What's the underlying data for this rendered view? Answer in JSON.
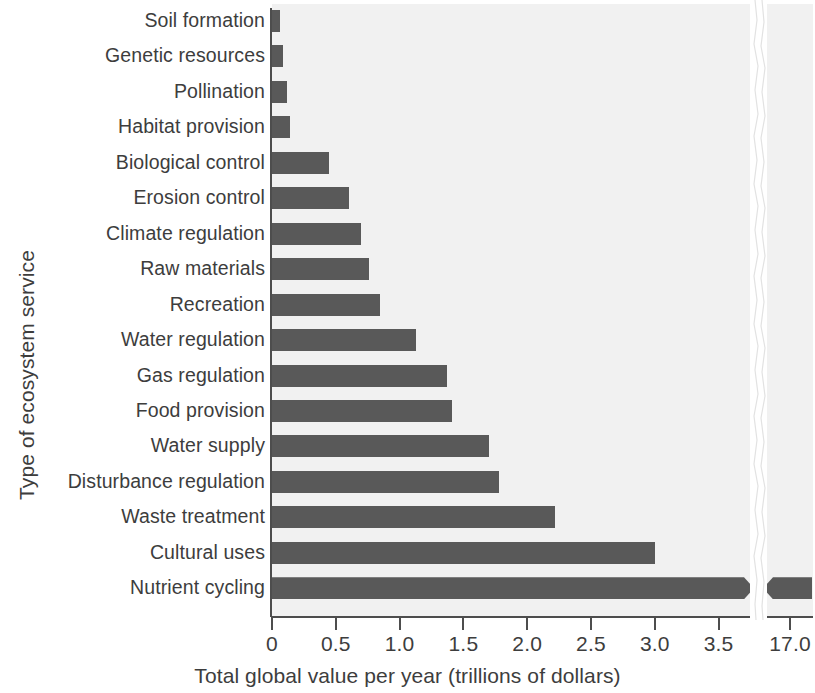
{
  "chart_data": {
    "type": "bar",
    "orientation": "horizontal",
    "title": "",
    "xlabel": "Total global value per year (trillions of dollars)",
    "ylabel": "Type of ecosystem service",
    "xlim": [
      0,
      3.7
    ],
    "axis_break": {
      "present": true,
      "break_after": 3.7,
      "resume_label": "17.0"
    },
    "grid": false,
    "legend": null,
    "bar_color": "#595959",
    "plot_background": "#f1f1f1",
    "xticks": [
      "0",
      "0.5",
      "1.0",
      "1.5",
      "2.0",
      "2.5",
      "3.0",
      "3.5",
      "17.0"
    ],
    "xtick_values": [
      0,
      0.5,
      1.0,
      1.5,
      2.0,
      2.5,
      3.0,
      3.5,
      17.0
    ],
    "categories": [
      "Soil formation",
      "Genetic resources",
      "Pollination",
      "Habitat provision",
      "Biological control",
      "Erosion control",
      "Climate regulation",
      "Raw materials",
      "Recreation",
      "Water regulation",
      "Gas regulation",
      "Food provision",
      "Water supply",
      "Disturbance regulation",
      "Waste treatment",
      "Cultural uses",
      "Nutrient cycling"
    ],
    "values": [
      0.06,
      0.09,
      0.12,
      0.14,
      0.45,
      0.6,
      0.7,
      0.76,
      0.85,
      1.13,
      1.37,
      1.41,
      1.7,
      1.78,
      2.22,
      3.0,
      17.0
    ]
  }
}
